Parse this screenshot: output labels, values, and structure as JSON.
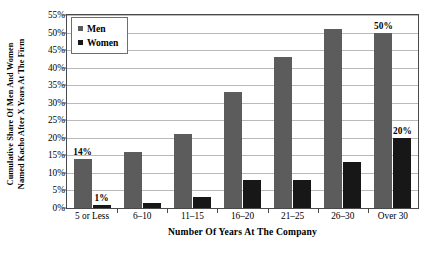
{
  "chart_data": {
    "type": "bar",
    "title": "",
    "subtitle": "",
    "xlabel": "Number Of Years At The Company",
    "ylabel": "Cumulative Share Of Men And Women Named Kacho After X Years At The Firm",
    "ylabel_line1": "Cumulative Share Of Men And Women",
    "ylabel_line2": "Named Kacho After X Years At The Firm",
    "categories": [
      "5 or Less",
      "6–10",
      "11–15",
      "16–20",
      "21–25",
      "26–30",
      "Over 30"
    ],
    "series": [
      {
        "name": "Men",
        "color": "#5c5c5c",
        "values": [
          14,
          16,
          21,
          33,
          43,
          51,
          50
        ]
      },
      {
        "name": "Women",
        "color": "#171717",
        "values": [
          1,
          1.5,
          3,
          8,
          8,
          13,
          20
        ]
      }
    ],
    "ylim": [
      0,
      55
    ],
    "ytick_values": [
      0,
      5,
      10,
      15,
      20,
      25,
      30,
      35,
      40,
      45,
      50,
      55
    ],
    "ytick_labels": [
      "0%",
      "5%",
      "10%",
      "15%",
      "20%",
      "25%",
      "30%",
      "35%",
      "40%",
      "45%",
      "50%",
      "55%"
    ],
    "grid": true,
    "grid_axis": "y",
    "legend_position": "top-left-inside",
    "data_labels": [
      {
        "series": "Men",
        "category": "5 or Less",
        "text": "14%"
      },
      {
        "series": "Women",
        "category": "5 or Less",
        "text": "1%"
      },
      {
        "series": "Men",
        "category": "Over 30",
        "text": "50%"
      },
      {
        "series": "Women",
        "category": "Over 30",
        "text": "20%"
      }
    ]
  },
  "legend": {
    "items": [
      {
        "label": "Men",
        "swatch": "men-swatch-icon"
      },
      {
        "label": "Women",
        "swatch": "women-swatch-icon"
      }
    ]
  }
}
